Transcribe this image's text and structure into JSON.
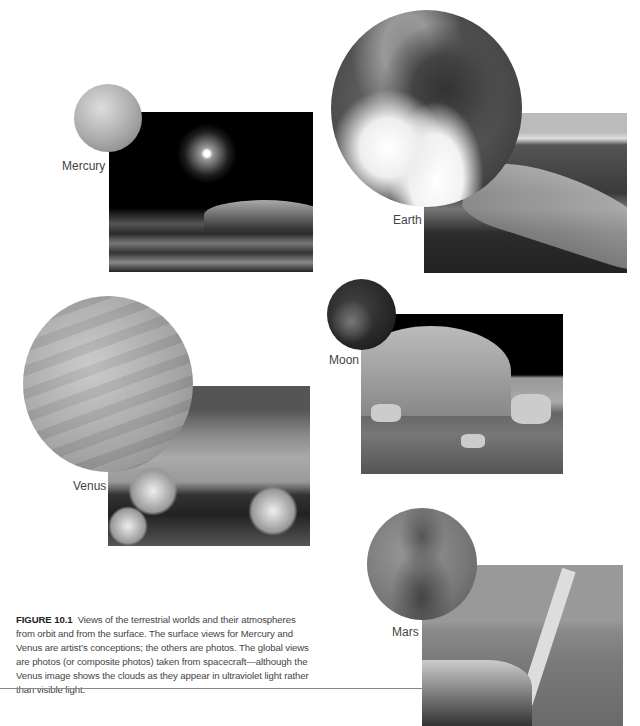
{
  "figure": {
    "number_label": "FIGURE 10.1",
    "caption_text": "Views of the terrestrial worlds and their atmospheres from orbit and from the surface. The surface views for Mercury and Venus are artist’s conceptions; the others are photos. The global views are photos (or composite photos) taken from spacecraft—although the Venus image shows the clouds as they appear in ultraviolet light rather than visible light."
  },
  "worlds": [
    {
      "name": "Mercury",
      "global_view": "mercury-globe",
      "surface_view": "mercury-surface-artist-conception"
    },
    {
      "name": "Earth",
      "global_view": "earth-globe-photo",
      "surface_view": "earth-surface-photo"
    },
    {
      "name": "Venus",
      "global_view": "venus-globe-ultraviolet",
      "surface_view": "venus-surface-artist-conception"
    },
    {
      "name": "Moon",
      "global_view": "moon-globe-photo",
      "surface_view": "moon-surface-photo"
    },
    {
      "name": "Mars",
      "global_view": "mars-globe-photo",
      "surface_view": "mars-surface-photo"
    }
  ]
}
